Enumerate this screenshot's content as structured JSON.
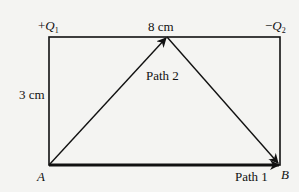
{
  "diagram": {
    "charges": {
      "left": {
        "sign": "+",
        "symbol": "Q",
        "subscript": "1"
      },
      "right": {
        "sign": "−",
        "symbol": "Q",
        "subscript": "2"
      }
    },
    "dimensions": {
      "width_label": "8 cm",
      "height_label": "3 cm"
    },
    "points": {
      "start": "A",
      "end": "B"
    },
    "paths": {
      "path1": "Path 1",
      "path2": "Path 2"
    },
    "colors": {
      "line": "#111111",
      "background": "#f4f4f2"
    }
  }
}
